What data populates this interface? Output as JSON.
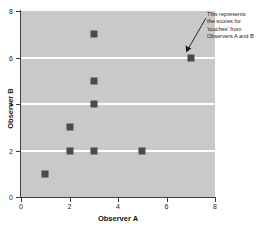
{
  "chart_data": {
    "type": "scatter",
    "title": "",
    "xlabel": "Observer A",
    "ylabel": "Observer B",
    "xlim": [
      0,
      8
    ],
    "ylim": [
      0,
      8
    ],
    "xticks": [
      0,
      2,
      4,
      6,
      8
    ],
    "yticks": [
      0,
      2,
      4,
      6,
      8
    ],
    "xtick_labels": [
      "0",
      "2",
      "4",
      "6",
      "8"
    ],
    "ytick_labels": [
      "0",
      "2",
      "4",
      "6",
      "8"
    ],
    "grid": "horizontal-white-lines-at-y-2-4-6",
    "gridlines_y": [
      2,
      4,
      6
    ],
    "legend": null,
    "plot_background_color": "#c9c9c9",
    "marker_color": "#4a4a4a",
    "marker_shape": "square",
    "points": [
      {
        "x": 1,
        "y": 1
      },
      {
        "x": 2,
        "y": 2
      },
      {
        "x": 2,
        "y": 3
      },
      {
        "x": 3,
        "y": 2
      },
      {
        "x": 3,
        "y": 4
      },
      {
        "x": 3,
        "y": 5
      },
      {
        "x": 3,
        "y": 7
      },
      {
        "x": 5,
        "y": 2
      },
      {
        "x": 7,
        "y": 6
      }
    ],
    "annotations": [
      {
        "lines": [
          "This represents",
          "the scores for",
          "'touches' from",
          "Observers A and B"
        ],
        "points_to": {
          "x": 7,
          "y": 6
        }
      }
    ]
  }
}
